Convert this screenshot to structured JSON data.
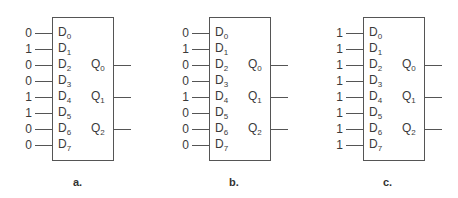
{
  "figure": {
    "type": "8-to-3 priority encoder input examples",
    "input_labels": [
      "D0",
      "D1",
      "D2",
      "D3",
      "D4",
      "D5",
      "D6",
      "D7"
    ],
    "output_labels": [
      "Q0",
      "Q1",
      "Q2"
    ],
    "panels": [
      {
        "caption": "a.",
        "inputs": [
          "0",
          "1",
          "0",
          "0",
          "1",
          "1",
          "0",
          "0"
        ]
      },
      {
        "caption": "b.",
        "inputs": [
          "0",
          "1",
          "0",
          "0",
          "1",
          "0",
          "0",
          "0"
        ]
      },
      {
        "caption": "c.",
        "inputs": [
          "1",
          "1",
          "1",
          "1",
          "1",
          "1",
          "1",
          "1"
        ]
      }
    ]
  }
}
